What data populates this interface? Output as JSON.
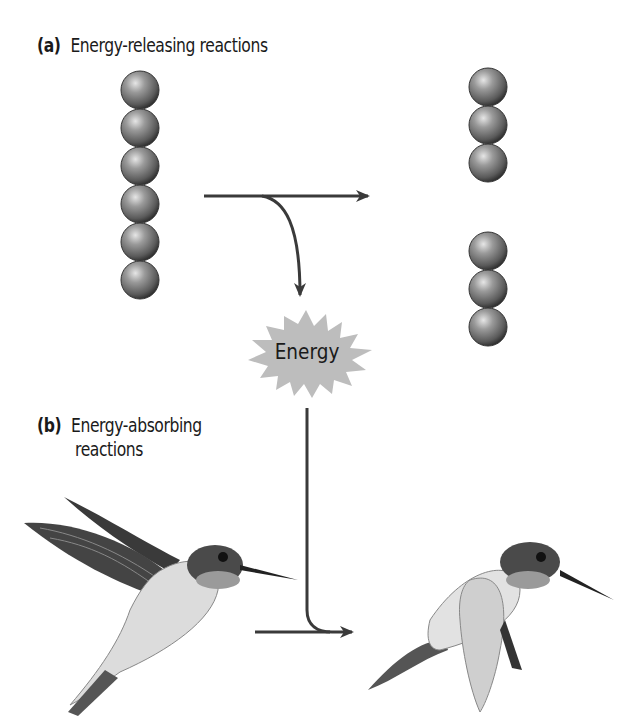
{
  "panel_a": {
    "tag": "(a)",
    "title": "Energy-releasing reactions",
    "reactant_chain_spheres": 6,
    "product_chains": [
      3,
      3
    ]
  },
  "energy_burst": {
    "label": "Energy",
    "fill_color": "#bdbdbd"
  },
  "panel_b": {
    "tag": "(b)",
    "title_line1": "Energy-absorbing",
    "title_line2": "reactions",
    "images": [
      "hummingbird-wings-up",
      "hummingbird-wings-down"
    ]
  },
  "colors": {
    "arrow": "#3a3a3a",
    "sphere": "#707070"
  }
}
